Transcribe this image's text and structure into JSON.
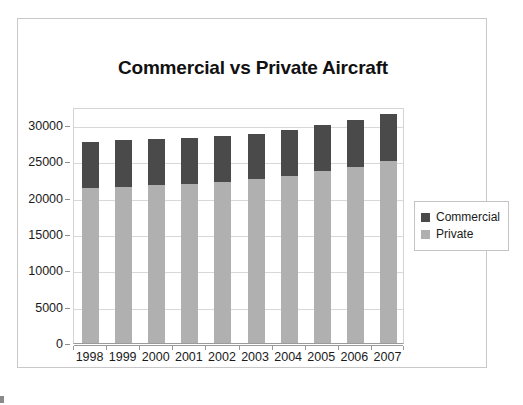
{
  "chart_data": {
    "type": "bar",
    "subtype": "stacked-column",
    "title": "Commercial vs Private Aircraft",
    "xlabel": "",
    "ylabel": "",
    "categories": [
      "1998",
      "1999",
      "2000",
      "2001",
      "2002",
      "2003",
      "2004",
      "2005",
      "2006",
      "2007"
    ],
    "series": [
      {
        "name": "Private",
        "color": "#b0b0b0",
        "values": [
          21400,
          21500,
          21700,
          21850,
          22200,
          22600,
          23000,
          23700,
          24300,
          25000
        ]
      },
      {
        "name": "Commercial",
        "color": "#4a4a4a",
        "values": [
          6350,
          6400,
          6350,
          6400,
          6350,
          6250,
          6350,
          6300,
          6450,
          6600
        ]
      }
    ],
    "totals": [
      27750,
      27900,
      28050,
      28250,
      28550,
      28850,
      29350,
      30000,
      30750,
      31600
    ],
    "ylim": [
      0,
      32500
    ],
    "yticks": [
      0,
      5000,
      10000,
      15000,
      20000,
      25000,
      30000
    ],
    "ytick_labels": [
      "0",
      "5000",
      "10000",
      "15000",
      "20000",
      "25000",
      "30000"
    ],
    "grid": true,
    "grid_axis": "y",
    "legend_position": "right",
    "stack_order": [
      "Private",
      "Commercial"
    ]
  },
  "legend": {
    "entries": [
      {
        "label": "Commercial",
        "color": "#4a4a4a"
      },
      {
        "label": "Private",
        "color": "#b0b0b0"
      }
    ]
  },
  "colors": {
    "commercial": "#4a4a4a",
    "private": "#b0b0b0",
    "grid": "#d8d8d8",
    "axis": "#9a9a9a",
    "frame": "#c8c8c8",
    "text": "#1a1a1a"
  }
}
